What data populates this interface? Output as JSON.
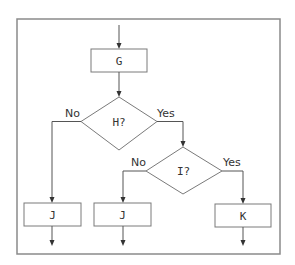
{
  "diagram": {
    "type": "flowchart",
    "colors": {
      "frame": "#8a8a8a",
      "shape_stroke": "#7a7a7a",
      "line": "#555555",
      "text": "#333333",
      "background": "#ffffff"
    },
    "nodes": {
      "g": {
        "kind": "process",
        "label": "G"
      },
      "h": {
        "kind": "decision",
        "label": "H?"
      },
      "i": {
        "kind": "decision",
        "label": "I?"
      },
      "j1": {
        "kind": "process",
        "label": "J"
      },
      "j2": {
        "kind": "process",
        "label": "J"
      },
      "k": {
        "kind": "process",
        "label": "K"
      }
    },
    "edges": {
      "h_no": {
        "from": "H?",
        "to": "J",
        "label": "No"
      },
      "h_yes": {
        "from": "H?",
        "to": "I?",
        "label": "Yes"
      },
      "i_no": {
        "from": "I?",
        "to": "J",
        "label": "No"
      },
      "i_yes": {
        "from": "I?",
        "to": "K",
        "label": "Yes"
      }
    }
  }
}
